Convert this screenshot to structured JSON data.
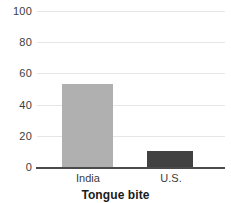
{
  "chart_data": {
    "type": "bar",
    "title": "",
    "xlabel": "Tongue bite",
    "ylabel": "",
    "categories": [
      "India",
      "U.S."
    ],
    "values": [
      53,
      10
    ],
    "series": [
      {
        "name": "Tongue bite",
        "values": [
          53,
          10
        ]
      }
    ],
    "ylim": [
      0,
      100
    ],
    "yticks": [
      0,
      20,
      40,
      60,
      80,
      100
    ],
    "ytick_labels": [
      "0",
      "20",
      "40",
      "60",
      "80",
      "100"
    ],
    "grid": true,
    "legend": "none",
    "bar_colors": [
      "#b0b0b0",
      "#414141"
    ],
    "axis_color": "#4a4a4a",
    "gridline_color": "#e6e6e6",
    "background": "#ffffff"
  }
}
